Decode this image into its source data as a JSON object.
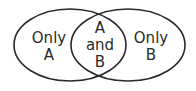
{
  "diagram": {
    "type": "venn",
    "sets": [
      "A",
      "B"
    ],
    "regions": {
      "only_a": {
        "line1": "Only",
        "line2": "A"
      },
      "a_and_b": {
        "line1": "A",
        "line2": "and",
        "line3": "B"
      },
      "only_b": {
        "line1": "Only",
        "line2": "B"
      }
    },
    "colors": {
      "stroke": "#2a2a2a",
      "background": "#ffffff"
    }
  }
}
